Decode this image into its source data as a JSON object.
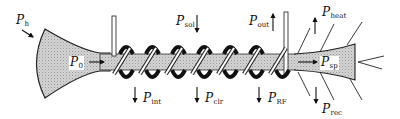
{
  "diagram": {
    "type": "power-flow schematic of a plasma/beam column with helical coil",
    "colors": {
      "fill": "#c9c9c9",
      "stroke": "#222222",
      "background": "#ffffff"
    },
    "labels": {
      "p_h": {
        "main": "P",
        "sub": "h"
      },
      "p_0": {
        "main": "P",
        "sub": "0"
      },
      "p_sol": {
        "main": "P",
        "sub": "sol"
      },
      "p_out": {
        "main": "P",
        "sub": "out"
      },
      "p_heat": {
        "main": "P",
        "sub": "heat"
      },
      "p_sp": {
        "main": "P",
        "sub": "sp"
      },
      "p_int": {
        "main": "P",
        "sub": "int"
      },
      "p_clr": {
        "main": "P",
        "sub": "clr"
      },
      "p_rf": {
        "main": "P",
        "sub": "RF"
      },
      "p_rec": {
        "main": "P",
        "sub": "rec"
      }
    },
    "arrows": {
      "p_h": "diagonal-in",
      "p_0": "right",
      "p_sol": "down",
      "p_out": "up",
      "p_heat": "up",
      "p_sp": "right",
      "p_int": "down",
      "p_clr": "down",
      "p_rf": "down",
      "p_rec": "down"
    },
    "coil_turns": 7
  }
}
